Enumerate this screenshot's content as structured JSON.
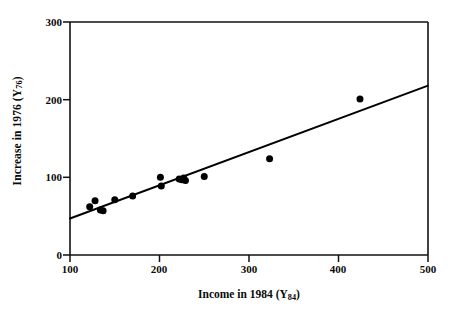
{
  "chart_data": {
    "type": "scatter",
    "title": "",
    "xlabel": "Income in 1984 (Y84)",
    "ylabel": "Increase in 1976 (Y76)",
    "xlabel_prefix": "Income in 1984 (Y",
    "xlabel_sub": "84",
    "xlabel_suffix": ")",
    "ylabel_prefix": "Increase in 1976 (Y",
    "ylabel_sub": "76",
    "ylabel_suffix": ")",
    "xlim": [
      100,
      500
    ],
    "ylim": [
      0,
      300
    ],
    "xticks": [
      100,
      200,
      300,
      400,
      500
    ],
    "yticks": [
      0,
      100,
      200,
      300
    ],
    "xtick_labels": [
      "100",
      "200",
      "300",
      "400",
      "500"
    ],
    "ytick_labels": [
      "0",
      "100",
      "200",
      "300"
    ],
    "grid": false,
    "legend": null,
    "marker_color": "#000000",
    "line_color": "#000000",
    "axis_color": "#000000",
    "background_color": "#ffffff",
    "points": [
      {
        "x": 122,
        "y": 62
      },
      {
        "x": 128,
        "y": 70
      },
      {
        "x": 134,
        "y": 58
      },
      {
        "x": 137,
        "y": 57
      },
      {
        "x": 150,
        "y": 71
      },
      {
        "x": 170,
        "y": 76
      },
      {
        "x": 201,
        "y": 100
      },
      {
        "x": 202,
        "y": 89
      },
      {
        "x": 222,
        "y": 98
      },
      {
        "x": 225,
        "y": 97
      },
      {
        "x": 227,
        "y": 99
      },
      {
        "x": 229,
        "y": 96
      },
      {
        "x": 250,
        "y": 101
      },
      {
        "x": 323,
        "y": 124
      },
      {
        "x": 424,
        "y": 201
      }
    ],
    "fit_line": {
      "type": "linear-regression",
      "x_start": 100,
      "y_start": 47,
      "x_end": 500,
      "y_end": 218
    }
  }
}
